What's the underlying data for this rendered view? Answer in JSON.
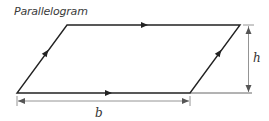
{
  "title": "Parallelogram",
  "labels": {
    "base": "b",
    "height": "h"
  },
  "shape": {
    "type": "parallelogram",
    "vertices": {
      "bottom_left": [
        17,
        93
      ],
      "bottom_right": [
        190,
        93
      ],
      "top_right": [
        240,
        25
      ],
      "top_left": [
        67,
        25
      ]
    }
  },
  "colors": {
    "outline": "#222222",
    "dimension": "#888888",
    "text": "#333333"
  }
}
